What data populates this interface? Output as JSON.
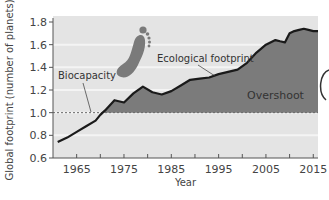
{
  "chart_data": {
    "type": "area",
    "title": "",
    "xlabel": "Year",
    "ylabel": "Global footprint (number of planets)",
    "xlim": [
      1960,
      2016
    ],
    "ylim": [
      0.6,
      1.8
    ],
    "x_ticks": [
      1965,
      1970,
      1975,
      1980,
      1985,
      1990,
      1995,
      2000,
      2005,
      2010,
      2015
    ],
    "x_tick_labels": [
      "1965",
      "1975",
      "1985",
      "1995",
      "2005",
      "2015"
    ],
    "y_ticks": [
      0.6,
      0.8,
      1.0,
      1.2,
      1.4,
      1.6,
      1.8
    ],
    "y_tick_labels": [
      "0.6",
      "0.8",
      "1.0",
      "1.2",
      "1.4",
      "1.6",
      "1.8"
    ],
    "grid": true,
    "series": [
      {
        "name": "Ecological footprint",
        "x": [
          1961,
          1963,
          1965,
          1967,
          1969,
          1970,
          1971,
          1973,
          1975,
          1977,
          1979,
          1981,
          1983,
          1985,
          1987,
          1989,
          1991,
          1993,
          1995,
          1997,
          1999,
          2001,
          2003,
          2005,
          2007,
          2008,
          2009,
          2010,
          2011,
          2012,
          2013,
          2014,
          2015,
          2016
        ],
        "values": [
          0.74,
          0.78,
          0.83,
          0.88,
          0.93,
          0.98,
          1.02,
          1.11,
          1.09,
          1.17,
          1.23,
          1.18,
          1.16,
          1.19,
          1.24,
          1.29,
          1.3,
          1.31,
          1.34,
          1.36,
          1.38,
          1.44,
          1.53,
          1.6,
          1.64,
          1.63,
          1.62,
          1.7,
          1.72,
          1.73,
          1.74,
          1.73,
          1.72,
          1.72
        ]
      },
      {
        "name": "Biocapacity",
        "x": [
          1960,
          2016
        ],
        "values": [
          1.0,
          1.0
        ],
        "style": "dashed"
      }
    ],
    "annotations": [
      "Ecological footprint",
      "Biocapacity",
      "Overshoot"
    ],
    "legend": "none (inline annotations)",
    "colors": {
      "plot_bg": "#e4e4e4",
      "grid_band": "#ededed",
      "overshoot_fill": "#7b7b7b",
      "line": "#1a1a1a",
      "footprint_icon": "#7a7a7a"
    }
  }
}
